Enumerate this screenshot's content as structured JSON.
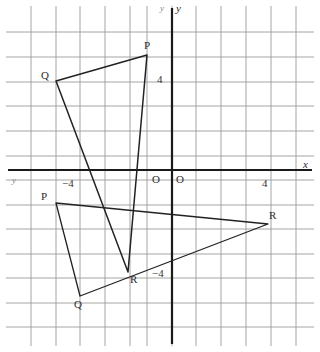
{
  "figure": {
    "kind": "coordinate-grid-diagram",
    "colors": {
      "paper": "#ffffff",
      "grid": "#9a9a9a",
      "axis": "#1a1a1a",
      "shape": "#222222",
      "label": "#2a2a2a",
      "faint": "#8a8a8a"
    }
  },
  "grid": {
    "origin_px": {
      "x": 172,
      "y": 170
    },
    "spacing_px": 24.7,
    "vertical_lines_px": [
      31,
      56,
      80,
      105,
      130,
      147,
      172,
      196,
      221,
      246,
      271,
      296
    ],
    "horizontal_lines_px": [
      32,
      57,
      82,
      106,
      131,
      156,
      170,
      180,
      205,
      229,
      254,
      278,
      303,
      327
    ],
    "x_range": [
      -6,
      5
    ],
    "y_range": [
      -6,
      5
    ]
  },
  "axes": {
    "x_axis_label": "x",
    "y_axis_label": "y",
    "origin_label_left": "O",
    "origin_label_right": "O",
    "stray_label_top_left": "y",
    "stray_label_bottom_left": "y",
    "ticks": [
      {
        "id": "x-neg-4",
        "text": "−4",
        "x_px": 62,
        "y_px": 178
      },
      {
        "id": "x-pos-4",
        "text": "4",
        "x_px": 262,
        "y_px": 178
      },
      {
        "id": "y-pos-4",
        "text": "4",
        "x_px": 157,
        "y_px": 74
      },
      {
        "id": "y-neg-4",
        "text": "−4",
        "x_px": 152,
        "y_px": 268
      }
    ]
  },
  "shapes": [
    {
      "name": "triangle-upper",
      "vertices": [
        {
          "label": "P",
          "px": {
            "x": 147,
            "y": 55
          },
          "label_px": {
            "x": 144,
            "y": 40
          },
          "coord": [
            -1,
            4.7
          ]
        },
        {
          "label": "Q",
          "px": {
            "x": 56,
            "y": 81
          },
          "label_px": {
            "x": 41,
            "y": 70
          },
          "coord": [
            -4.7,
            3.6
          ]
        },
        {
          "label": "R",
          "px": {
            "x": 128,
            "y": 272
          },
          "label_px": {
            "x": 130,
            "y": 274
          },
          "coord": [
            -1.8,
            -4.1
          ]
        }
      ]
    },
    {
      "name": "triangle-lower",
      "vertices": [
        {
          "label": "P",
          "px": {
            "x": 56,
            "y": 203
          },
          "label_px": {
            "x": 41,
            "y": 191
          },
          "coord": [
            -4.7,
            -1.3
          ]
        },
        {
          "label": "Q",
          "px": {
            "x": 80,
            "y": 296
          },
          "label_px": {
            "x": 74,
            "y": 299
          },
          "coord": [
            -3.7,
            -5.1
          ]
        },
        {
          "label": "R",
          "px": {
            "x": 268,
            "y": 224
          },
          "label_px": {
            "x": 269,
            "y": 210
          },
          "coord": [
            3.9,
            -2.2
          ]
        }
      ]
    }
  ]
}
